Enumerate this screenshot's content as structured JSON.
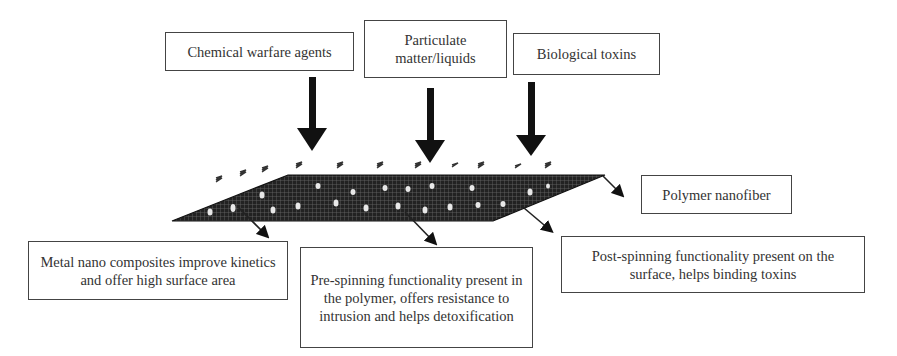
{
  "diagram": {
    "inputs": [
      {
        "id": "chemical",
        "label": "Chemical warfare agents"
      },
      {
        "id": "particulate",
        "label": "Particulate matter/liquids"
      },
      {
        "id": "biological",
        "label": "Biological toxins"
      }
    ],
    "sheet_label": "Polymer nanofiber",
    "annotations": [
      {
        "id": "metal",
        "label": "Metal nano composites improve kinetics and offer high surface area"
      },
      {
        "id": "pre_spinning",
        "label": "Pre-spinning functionality present in the polymer, offers resistance to intrusion and helps detoxification"
      },
      {
        "id": "post_spinning",
        "label": "Post-spinning functionality present on the surface, helps binding toxins"
      }
    ],
    "colors": {
      "sheet": "#1a1a1a",
      "arrow": "#111111",
      "border": "#444444",
      "text": "#333333"
    }
  }
}
